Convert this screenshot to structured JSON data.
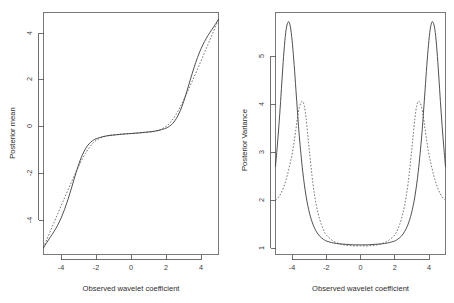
{
  "figure": {
    "name": "bayesian-wavelet-shrinkage-figure",
    "panel_count": 2,
    "background": "#ffffff",
    "foreground": "#3c3c3c"
  },
  "chart_data": [
    {
      "id": "posterior-mean",
      "type": "line",
      "title": "",
      "xlabel": "Observed wavelet coefficient",
      "ylabel": "Posterior mean",
      "xlim": [
        -5,
        5
      ],
      "ylim": [
        -5,
        5
      ],
      "xticks": [
        -4,
        -2,
        0,
        2,
        4
      ],
      "yticks": [
        -4,
        -2,
        0,
        2,
        4
      ],
      "xtick_labels": [
        "-4",
        "-2",
        "0",
        "2",
        "4"
      ],
      "ytick_labels": [
        "-4",
        "-2",
        "0",
        "2",
        "4"
      ],
      "grid": false,
      "legend": false,
      "legend_position": "none",
      "series": [
        {
          "name": "solid-rule",
          "style": "solid",
          "color": "#3c3c3c",
          "x": [
            -5.0,
            -4.8,
            -4.6,
            -4.4,
            -4.2,
            -4.0,
            -3.8,
            -3.6,
            -3.4,
            -3.2,
            -3.0,
            -2.8,
            -2.6,
            -2.4,
            -2.2,
            -2.0,
            -1.6,
            -1.2,
            -0.8,
            -0.4,
            0.0,
            0.4,
            0.8,
            1.2,
            1.6,
            2.0,
            2.2,
            2.4,
            2.6,
            2.8,
            3.0,
            3.2,
            3.4,
            3.6,
            3.8,
            4.0,
            4.2,
            4.4,
            4.6,
            4.8,
            5.0
          ],
          "y": [
            -4.72,
            -4.49,
            -4.27,
            -4.05,
            -3.8,
            -3.5,
            -3.14,
            -2.72,
            -2.25,
            -1.76,
            -1.3,
            -0.92,
            -0.63,
            -0.43,
            -0.3,
            -0.22,
            -0.13,
            -0.08,
            -0.05,
            -0.02,
            0.0,
            0.02,
            0.05,
            0.08,
            0.13,
            0.22,
            0.3,
            0.43,
            0.63,
            0.92,
            1.3,
            1.76,
            2.25,
            2.72,
            3.14,
            3.5,
            3.8,
            4.05,
            4.27,
            4.49,
            4.72
          ]
        },
        {
          "name": "dashed-rule",
          "style": "dashed",
          "color": "#6e6e6e",
          "x": [
            -5.0,
            -4.8,
            -4.6,
            -4.4,
            -4.2,
            -4.0,
            -3.8,
            -3.6,
            -3.4,
            -3.2,
            -3.0,
            -2.8,
            -2.6,
            -2.4,
            -2.2,
            -2.0,
            -1.6,
            -1.2,
            -0.8,
            -0.4,
            0.0,
            0.4,
            0.8,
            1.2,
            1.6,
            2.0,
            2.2,
            2.4,
            2.6,
            2.8,
            3.0,
            3.2,
            3.4,
            3.6,
            3.8,
            4.0,
            4.2,
            4.4,
            4.6,
            4.8,
            5.0
          ],
          "y": [
            -4.72,
            -4.36,
            -4.02,
            -3.68,
            -3.34,
            -3.0,
            -2.66,
            -2.33,
            -2.0,
            -1.68,
            -1.37,
            -1.08,
            -0.82,
            -0.6,
            -0.42,
            -0.29,
            -0.14,
            -0.07,
            -0.04,
            -0.02,
            0.0,
            0.02,
            0.04,
            0.07,
            0.14,
            0.29,
            0.42,
            0.6,
            0.82,
            1.08,
            1.37,
            1.68,
            2.0,
            2.33,
            2.66,
            3.0,
            3.34,
            3.68,
            4.02,
            4.36,
            4.72
          ]
        }
      ]
    },
    {
      "id": "posterior-variance",
      "type": "line",
      "title": "",
      "xlabel": "Observed wavelet coefficient",
      "ylabel": "Posterior Variance",
      "xlim": [
        -5,
        5
      ],
      "ylim": [
        0.82,
        5.85
      ],
      "xticks": [
        -4,
        -2,
        0,
        2,
        4
      ],
      "yticks": [
        1,
        2,
        3,
        4,
        5
      ],
      "xtick_labels": [
        "-4",
        "-2",
        "0",
        "2",
        "4"
      ],
      "ytick_labels": [
        "1",
        "2",
        "3",
        "4",
        "5"
      ],
      "grid": false,
      "legend": false,
      "legend_position": "none",
      "series": [
        {
          "name": "solid-variance",
          "style": "solid",
          "color": "#3c3c3c",
          "peak_positions": [
            -4.2,
            4.2
          ],
          "peak_value": 5.65,
          "floor_value": 1.02,
          "x": [
            -5.0,
            -4.9,
            -4.8,
            -4.7,
            -4.6,
            -4.5,
            -4.4,
            -4.3,
            -4.2,
            -4.1,
            -4.0,
            -3.9,
            -3.8,
            -3.7,
            -3.6,
            -3.4,
            -3.2,
            -3.0,
            -2.8,
            -2.6,
            -2.4,
            -2.2,
            -2.0,
            -1.6,
            -1.2,
            -0.8,
            -0.4,
            0.0,
            0.4,
            0.8,
            1.2,
            1.6,
            2.0,
            2.2,
            2.4,
            2.6,
            2.8,
            3.0,
            3.2,
            3.4,
            3.6,
            3.7,
            3.8,
            3.9,
            4.0,
            4.1,
            4.2,
            4.3,
            4.4,
            4.5,
            4.6,
            4.7,
            4.8,
            4.9,
            5.0
          ],
          "y": [
            2.65,
            3.05,
            3.5,
            4.0,
            4.55,
            5.05,
            5.43,
            5.62,
            5.65,
            5.5,
            5.18,
            4.75,
            4.25,
            3.75,
            3.28,
            2.55,
            2.03,
            1.68,
            1.45,
            1.3,
            1.2,
            1.14,
            1.1,
            1.06,
            1.04,
            1.03,
            1.02,
            1.02,
            1.02,
            1.03,
            1.04,
            1.06,
            1.1,
            1.14,
            1.2,
            1.3,
            1.45,
            1.68,
            2.03,
            2.55,
            3.28,
            3.75,
            4.25,
            4.75,
            5.18,
            5.5,
            5.65,
            5.62,
            5.43,
            5.05,
            4.55,
            4.0,
            3.5,
            3.05,
            2.65
          ]
        },
        {
          "name": "dashed-variance",
          "style": "dashed",
          "color": "#6e6e6e",
          "peak_positions": [
            -3.4,
            3.4
          ],
          "peak_value": 4.0,
          "floor_value": 1.0,
          "x": [
            -5.0,
            -4.8,
            -4.6,
            -4.4,
            -4.2,
            -4.0,
            -3.8,
            -3.7,
            -3.6,
            -3.5,
            -3.4,
            -3.3,
            -3.2,
            -3.1,
            -3.0,
            -2.8,
            -2.6,
            -2.4,
            -2.2,
            -2.0,
            -1.6,
            -1.2,
            -0.8,
            -0.4,
            0.0,
            0.4,
            0.8,
            1.2,
            1.6,
            2.0,
            2.2,
            2.4,
            2.6,
            2.8,
            3.0,
            3.1,
            3.2,
            3.3,
            3.4,
            3.5,
            3.6,
            3.7,
            3.8,
            4.0,
            4.2,
            4.4,
            4.6,
            4.8,
            5.0
          ],
          "y": [
            1.95,
            2.02,
            2.15,
            2.35,
            2.62,
            2.95,
            3.42,
            3.68,
            3.87,
            3.98,
            4.0,
            3.9,
            3.65,
            3.3,
            2.95,
            2.3,
            1.85,
            1.55,
            1.35,
            1.22,
            1.1,
            1.04,
            1.01,
            1.0,
            1.0,
            1.0,
            1.01,
            1.04,
            1.1,
            1.22,
            1.35,
            1.55,
            1.85,
            2.3,
            2.95,
            3.3,
            3.65,
            3.9,
            4.0,
            3.98,
            3.87,
            3.68,
            3.42,
            2.95,
            2.62,
            2.35,
            2.15,
            2.02,
            1.95
          ]
        }
      ]
    }
  ]
}
